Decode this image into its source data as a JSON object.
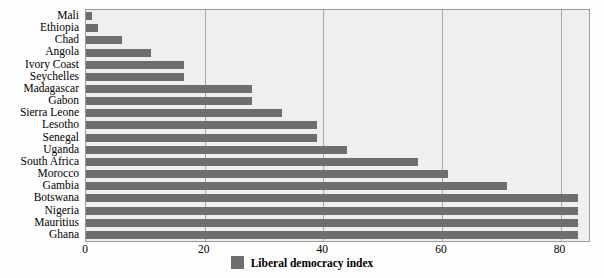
{
  "chart_data": {
    "type": "bar",
    "orientation": "horizontal",
    "title": "",
    "xlabel": "",
    "ylabel": "",
    "xlim": [
      0,
      84.8
    ],
    "xticks": [
      0,
      20,
      40,
      60,
      80
    ],
    "grid": "vertical",
    "legend_position": "bottom-center",
    "series": [
      {
        "name": "Liberal democracy index",
        "color": "#6e6e6e",
        "values": [
          1,
          2,
          6,
          11,
          16.5,
          16.5,
          28,
          28,
          33,
          39,
          39,
          44,
          56,
          61,
          71,
          83,
          83,
          83,
          83
        ]
      }
    ],
    "categories": [
      "Mali",
      "Ethiopia",
      "Chad",
      "Angola",
      "Ivory Coast",
      "Seychelles",
      "Madagascar",
      "Gabon",
      "Sierra Leone",
      "Lesotho",
      "Senegal",
      "Uganda",
      "South Africa",
      "Morocco",
      "Gambia",
      "Botswana",
      "Nigeria",
      "Mauritius",
      "Ghana"
    ],
    "points": [
      {
        "category": "Mali",
        "value": 1
      },
      {
        "category": "Ethiopia",
        "value": 2
      },
      {
        "category": "Chad",
        "value": 6
      },
      {
        "category": "Angola",
        "value": 11
      },
      {
        "category": "Ivory Coast",
        "value": 16.5
      },
      {
        "category": "Seychelles",
        "value": 16.5
      },
      {
        "category": "Madagascar",
        "value": 28
      },
      {
        "category": "Gabon",
        "value": 28
      },
      {
        "category": "Sierra Leone",
        "value": 33
      },
      {
        "category": "Lesotho",
        "value": 39
      },
      {
        "category": "Senegal",
        "value": 39
      },
      {
        "category": "Uganda",
        "value": 44
      },
      {
        "category": "South Africa",
        "value": 56
      },
      {
        "category": "Morocco",
        "value": 61
      },
      {
        "category": "Gambia",
        "value": 71
      },
      {
        "category": "Botswana",
        "value": 83
      },
      {
        "category": "Nigeria",
        "value": 83
      },
      {
        "category": "Mauritius",
        "value": 83
      },
      {
        "category": "Ghana",
        "value": 83
      }
    ]
  },
  "legend": {
    "label": "Liberal democracy index",
    "swatch_color": "#6e6e6e"
  },
  "colors": {
    "bar": "#6e6e6e",
    "plot_background": "#efefef",
    "gridline": "#a8a8a8",
    "axis_border": "#9a9a9a",
    "text": "#000000"
  }
}
